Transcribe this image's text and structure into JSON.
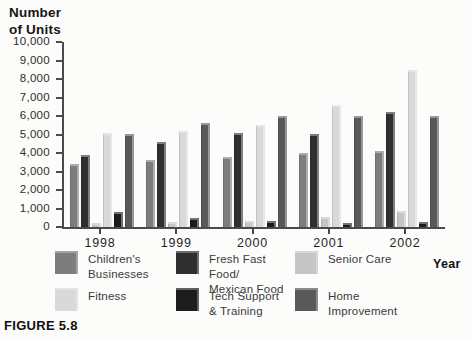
{
  "figure_label": "FIGURE 5.8",
  "chart_data": {
    "type": "bar",
    "title": "Number\nof Units",
    "xlabel": "Year",
    "ylabel": "Number of Units",
    "ylim": [
      0,
      10000
    ],
    "ytick_step": 1000,
    "yticks": [
      "10,000",
      "9,000",
      "8,000",
      "7,000",
      "6,000",
      "5,000",
      "4,000",
      "3,000",
      "2,000",
      "1,000",
      "0"
    ],
    "categories": [
      "1998",
      "1999",
      "2000",
      "2001",
      "2002"
    ],
    "grid": false,
    "legend_position": "bottom",
    "series": [
      {
        "name": "Children's Businesses",
        "legend_label": "Children's\nBusinesses",
        "color": "#7d7d7d",
        "values": [
          3400,
          3600,
          3800,
          4000,
          4100
        ]
      },
      {
        "name": "Fresh Fast Food/Mexican Food",
        "legend_label": "Fresh Fast Food/\nMexican Food",
        "color": "#2f2f2f",
        "values": [
          3900,
          4600,
          5100,
          5000,
          6200
        ]
      },
      {
        "name": "Senior Care",
        "legend_label": "Senior Care",
        "color": "#c6c6c6",
        "values": [
          200,
          250,
          350,
          550,
          850
        ]
      },
      {
        "name": "Fitness",
        "legend_label": "Fitness",
        "color": "#d9d9d9",
        "values": [
          5100,
          5200,
          5500,
          6600,
          8500
        ]
      },
      {
        "name": "Tech Support & Training",
        "legend_label": "Tech Support\n& Training",
        "color": "#1c1c1c",
        "values": [
          800,
          500,
          300,
          200,
          250
        ]
      },
      {
        "name": "Home Improvement",
        "legend_label": "Home\nImprovement",
        "color": "#595959",
        "values": [
          5000,
          5600,
          6000,
          6000,
          6000
        ]
      }
    ]
  }
}
